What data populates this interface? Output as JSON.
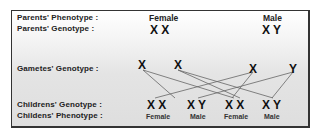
{
  "labels": {
    "parents_phenotype": "Parents' Phenotype :",
    "parents_genotype": "Parents' Genotype :",
    "gametes_genotype": "Gametes' Genotype :",
    "childrens_genotype": "Childrens' Genotype :",
    "childrens_phenotype": "Childens' Phenotype :"
  },
  "parents": {
    "female": {
      "phenotype": "Female",
      "genotype": "X X"
    },
    "male": {
      "phenotype": "Male",
      "genotype": "X Y"
    }
  },
  "gametes": [
    "X",
    "X",
    "X",
    "Y"
  ],
  "children": [
    {
      "genotype": "X X",
      "phenotype": "Female"
    },
    {
      "genotype": "X Y",
      "phenotype": "Male"
    },
    {
      "genotype": "X X",
      "phenotype": "Female"
    },
    {
      "genotype": "X Y",
      "phenotype": "Male"
    }
  ]
}
